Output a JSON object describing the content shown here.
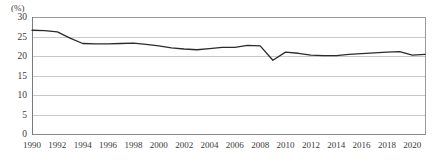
{
  "chart_data": {
    "type": "line",
    "title": "",
    "subtitle": "",
    "xlabel": "",
    "ylabel": "",
    "unit_label": "(%)",
    "grid": true,
    "legend": "none",
    "xlim": [
      1990,
      2021
    ],
    "ylim": [
      0,
      30
    ],
    "ytick_labels": [
      "30",
      "25",
      "20",
      "15",
      "10",
      "5",
      "0"
    ],
    "ytick_values": [
      30,
      25,
      20,
      15,
      10,
      5,
      0
    ],
    "xtick_labels": [
      "1990",
      "1992",
      "1994",
      "1996",
      "1998",
      "2000",
      "2002",
      "2004",
      "2006",
      "2008",
      "2010",
      "2012",
      "2014",
      "2016",
      "2018",
      "2020"
    ],
    "xtick_values": [
      1990,
      1992,
      1994,
      1996,
      1998,
      2000,
      2002,
      2004,
      2006,
      2008,
      2010,
      2012,
      2014,
      2016,
      2018,
      2020
    ],
    "line_color": "#2b2b2b",
    "series": [
      {
        "name": "series-1",
        "x": [
          1990,
          1991,
          1992,
          1993,
          1994,
          1995,
          1996,
          1997,
          1998,
          1999,
          2000,
          2001,
          2002,
          2003,
          2004,
          2005,
          2006,
          2007,
          2008,
          2009,
          2010,
          2011,
          2012,
          2013,
          2014,
          2015,
          2016,
          2017,
          2018,
          2019,
          2020,
          2021
        ],
        "values": [
          26.6,
          26.5,
          26.2,
          24.6,
          23.2,
          23.1,
          23.1,
          23.2,
          23.3,
          23.0,
          22.6,
          22.1,
          21.8,
          21.6,
          21.9,
          22.2,
          22.2,
          22.7,
          22.6,
          18.9,
          21.0,
          20.7,
          20.2,
          20.1,
          20.1,
          20.4,
          20.6,
          20.8,
          21.0,
          21.1,
          20.2,
          20.4
        ]
      }
    ]
  }
}
